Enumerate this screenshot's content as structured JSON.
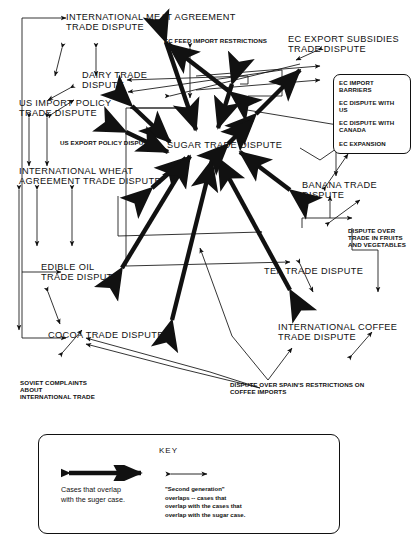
{
  "diagram": {
    "type": "node-link-diagram",
    "ink_color": "#111111",
    "background": "#ffffff",
    "nodes": [
      {
        "id": "meat",
        "label": "INTERNATIONAL MEAT AGREEMENT\nTRADE DISPUTE",
        "size": "big"
      },
      {
        "id": "dairy",
        "label": "DAIRY TRADE\nDISPUTE",
        "size": "big"
      },
      {
        "id": "usimport",
        "label": "US IMPORT POLICY\nTRADE DISPUTE",
        "size": "big"
      },
      {
        "id": "usexport",
        "label": "US EXPORT POLICY DISPUTE",
        "size": "small"
      },
      {
        "id": "wheat",
        "label": "INTERNATIONAL WHEAT\nAGREEMENT TRADE DISPUTE",
        "size": "big"
      },
      {
        "id": "ecfeed",
        "label": "EC FEED IMPORT RESTRICTIONS",
        "size": "small"
      },
      {
        "id": "ecexport",
        "label": "EC EXPORT SUBSIDIES\nTRADE DISPUTE",
        "size": "big"
      },
      {
        "id": "sugar",
        "label": "SUGAR TRADE DISPUTE",
        "size": "big"
      },
      {
        "id": "banana",
        "label": "BANANA TRADE\nDISPUTE",
        "size": "big"
      },
      {
        "id": "edibleoil",
        "label": "EDIBLE OIL\nTRADE DISPUTE",
        "size": "big"
      },
      {
        "id": "tea",
        "label": "TEA TRADE DISPUTE",
        "size": "big"
      },
      {
        "id": "cocoa",
        "label": "COCOA TRADE DISPUTE",
        "size": "big"
      },
      {
        "id": "coffee",
        "label": "INTERNATIONAL COFFEE\nTRADE DISPUTE",
        "size": "big"
      },
      {
        "id": "fruitveg",
        "label": "DISPUTE OVER\nTRADE IN FRUITS\nAND VEGETABLES",
        "size": "small"
      },
      {
        "id": "soviet",
        "label": "SOVIET COMPLAINTS\nABOUT\nINTERNATIONAL TRADE",
        "size": "small"
      },
      {
        "id": "spain",
        "label": "DISPUTE OVER SPAIN'S RESTRICTIONS ON\nCOFFEE IMPORTS",
        "size": "small"
      }
    ],
    "ec_box": {
      "items": [
        "EC IMPORT\nBARRIERS",
        "EC DISPUTE WITH\nUS",
        "EC DISPUTE WITH\nCANADA",
        "EC EXPANSION"
      ]
    },
    "key": {
      "title": "KEY",
      "thick_label": "Cases that overlap\nwith the suger case.",
      "thin_label": "\"Second generation\"\noverlaps -- cases that\noverlap with the cases that\noverlap with the sugar case."
    }
  }
}
